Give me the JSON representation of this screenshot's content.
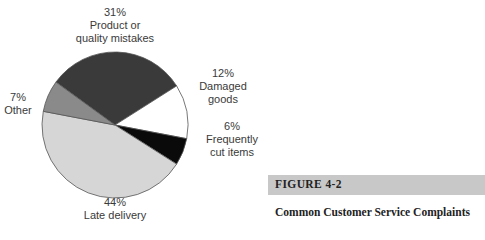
{
  "chart_data": {
    "type": "pie",
    "title": "Common Customer Service Complaints",
    "start_angle_deg": 216,
    "slices": [
      {
        "label": "Product or quality mistakes",
        "value": 31,
        "pct_text": "31%",
        "color": "#3a3a3a"
      },
      {
        "label": "Damaged goods",
        "value": 12,
        "pct_text": "12%",
        "color": "#ffffff"
      },
      {
        "label": "Frequently cut items",
        "value": 6,
        "pct_text": "6%",
        "color": "#0a0a0a"
      },
      {
        "label": "Late delivery",
        "value": 44,
        "pct_text": "44%",
        "color": "#d6d6d6"
      },
      {
        "label": "Other",
        "value": 7,
        "pct_text": "7%",
        "color": "#8a8a8a"
      }
    ],
    "labels_display": [
      [
        "31%",
        "Product or",
        "quality mistakes"
      ],
      [
        "12%",
        "Damaged",
        "goods"
      ],
      [
        "6%",
        "Frequently",
        "cut items"
      ],
      [
        "44%",
        "Late delivery"
      ],
      [
        "7%",
        "Other"
      ]
    ]
  },
  "figure": {
    "number": "FIGURE 4-2",
    "title": "Common Customer Service Complaints",
    "cut_off_text": "Source: Cut... The Right Word..."
  }
}
